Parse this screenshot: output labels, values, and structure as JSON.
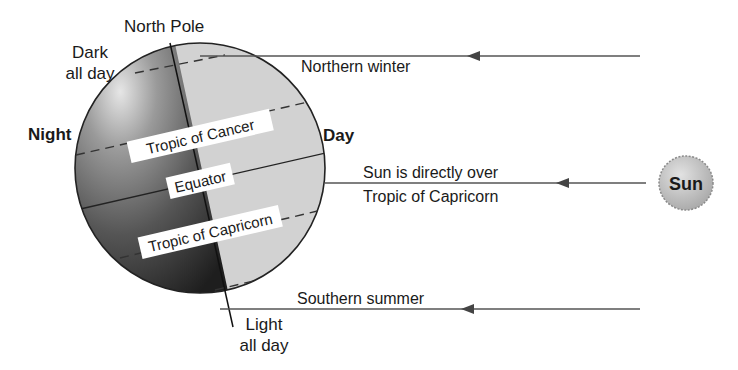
{
  "diagram": {
    "title_labels": {
      "north_pole": "North Pole",
      "dark_all_day_line1": "Dark",
      "dark_all_day_line2": "all day",
      "light_all_day_line1": "Light",
      "light_all_day_line2": "all day",
      "night": "Night",
      "day": "Day"
    },
    "globe_lines": {
      "tropic_of_cancer": "Tropic of Cancer",
      "equator": "Equator",
      "tropic_of_capricorn": "Tropic of Capricorn"
    },
    "sun_rays": [
      {
        "label": "Northern winter"
      },
      {
        "label_line1": "Sun is directly over",
        "label_line2": "Tropic of Capricorn"
      },
      {
        "label": "Southern summer"
      }
    ],
    "sun": {
      "label": "Sun"
    },
    "colors": {
      "night_side": "#5a5a5a",
      "night_highlight": "#d8d8d8",
      "day_side": "#d3d3d3",
      "ray_line": "#555555",
      "sun_fill": "#bdbdbd"
    }
  }
}
